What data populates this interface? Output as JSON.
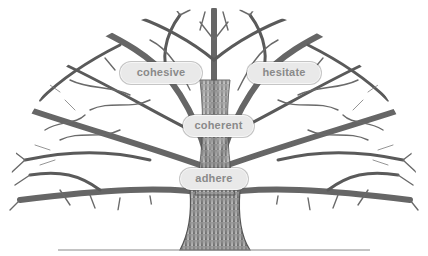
{
  "diagram": {
    "type": "word-tree illustration",
    "colors": {
      "background": "#ffffff",
      "branches": "#555555",
      "label_fill": "#e9e9e9",
      "label_text": "#8a8a8a",
      "ground_line": "#888888"
    },
    "labels": [
      {
        "id": "cohesive",
        "text": "cohesive",
        "x": 120,
        "y": 62,
        "w": 82
      },
      {
        "id": "hesitate",
        "text": "hesitate",
        "x": 247,
        "y": 62,
        "w": 74
      },
      {
        "id": "coherent",
        "text": "coherent",
        "x": 183,
        "y": 115,
        "w": 71
      },
      {
        "id": "adhere",
        "text": "adhere",
        "x": 180,
        "y": 168,
        "w": 68
      }
    ]
  }
}
